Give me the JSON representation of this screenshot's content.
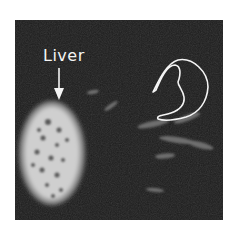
{
  "image": {
    "description": "Grayscale fluorescence/scan image of an organ region with labeled liver and a hand-drawn outline",
    "annotations": {
      "liver_label": "Liver",
      "arrow": "down-arrow pointing to liver",
      "outline": "hand-drawn white curved outline (C/3-shaped) at upper right"
    },
    "colors": {
      "background": "#1c1c1c",
      "liver": "#d8d8d8",
      "annotation": "#f4f4f4",
      "page": "#ffffff"
    }
  }
}
